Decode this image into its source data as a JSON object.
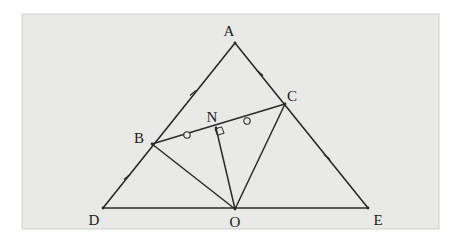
{
  "figure": {
    "kind": "geometry-diagram",
    "canvas": {
      "width": 465,
      "height": 241
    },
    "panel": {
      "x": 22,
      "y": 14,
      "width": 417,
      "height": 215,
      "fill": "#e9e9e7",
      "stroke": "#cfcfcc"
    },
    "background_color": "#ffffff",
    "line_color": "#2a2a2a",
    "label_color": "#1b1b1b",
    "points": [
      {
        "id": "A",
        "label": "A",
        "x": 235,
        "y": 43,
        "label_x": 229,
        "label_y": 36,
        "label_anchor": "middle"
      },
      {
        "id": "B",
        "label": "B",
        "x": 152,
        "y": 144,
        "label_x": 139,
        "label_y": 143,
        "label_anchor": "middle"
      },
      {
        "id": "C",
        "label": "C",
        "x": 285,
        "y": 104,
        "label_x": 292,
        "label_y": 101,
        "label_anchor": "middle"
      },
      {
        "id": "N",
        "label": "N",
        "x": 216,
        "y": 128,
        "label_x": 212,
        "label_y": 122,
        "label_anchor": "middle"
      },
      {
        "id": "D",
        "label": "D",
        "x": 103,
        "y": 208,
        "label_x": 94,
        "label_y": 225,
        "label_anchor": "middle"
      },
      {
        "id": "O",
        "label": "O",
        "x": 235,
        "y": 209,
        "label_x": 235,
        "label_y": 227,
        "label_anchor": "middle"
      },
      {
        "id": "E",
        "label": "E",
        "x": 368,
        "y": 208,
        "label_x": 378,
        "label_y": 225,
        "label_anchor": "middle"
      }
    ],
    "segments": [
      {
        "id": "DA",
        "from": "D",
        "to": "A",
        "weight": 1.6
      },
      {
        "id": "AE",
        "from": "A",
        "to": "E",
        "weight": 1.6
      },
      {
        "id": "DE",
        "from": "D",
        "to": "E",
        "weight": 1.6
      },
      {
        "id": "BC",
        "from": "B",
        "to": "C",
        "weight": 1.5
      },
      {
        "id": "BO",
        "from": "B",
        "to": "O",
        "weight": 1.5
      },
      {
        "id": "NO",
        "from": "N",
        "to": "O",
        "weight": 1.5
      },
      {
        "id": "CO",
        "from": "C",
        "to": "O",
        "weight": 1.5
      }
    ],
    "tick_marks": [
      {
        "id": "tick-AB",
        "on": "segment A-B",
        "x": 193,
        "y": 93,
        "angle": 50,
        "style": "single-cross"
      },
      {
        "id": "tick-AC",
        "on": "segment A-C",
        "x": 260,
        "y": 73,
        "angle": -50,
        "style": "single-cross"
      },
      {
        "id": "tick-DB",
        "on": "segment D-B",
        "x": 127,
        "y": 177,
        "angle": 50,
        "style": "single-cross"
      },
      {
        "id": "tick-CE",
        "on": "segment C-E",
        "x": 327,
        "y": 157,
        "angle": -50,
        "style": "single-cross"
      }
    ],
    "circle_marks": [
      {
        "id": "mark-BN",
        "on": "segment B-N",
        "x": 187,
        "y": 135,
        "r": 3.2
      },
      {
        "id": "mark-NC",
        "on": "segment N-C",
        "x": 247,
        "y": 121,
        "r": 3.2
      }
    ],
    "right_angle_marks": [
      {
        "id": "right-angle-N",
        "at": "N",
        "x": 216,
        "y": 128,
        "size": 7
      }
    ]
  }
}
